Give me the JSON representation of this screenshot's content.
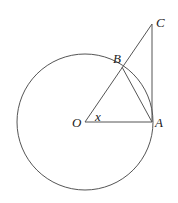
{
  "diagram": {
    "colors": {
      "stroke": "#555555",
      "label": "#222222",
      "background": "#ffffff"
    },
    "circle": {
      "center": "O",
      "cx": 85,
      "cy": 122,
      "r": 68
    },
    "points": {
      "O": {
        "x": 85,
        "y": 122
      },
      "A": {
        "x": 152,
        "y": 122
      },
      "B": {
        "x": 122,
        "y": 67
      },
      "C": {
        "x": 152,
        "y": 24
      }
    },
    "segments": [
      {
        "from": "O",
        "to": "A"
      },
      {
        "from": "O",
        "to": "C"
      },
      {
        "from": "A",
        "to": "C"
      },
      {
        "from": "A",
        "to": "B"
      }
    ],
    "labels": {
      "O": "O",
      "A": "A",
      "B": "B",
      "C": "C",
      "angle": "x"
    }
  }
}
